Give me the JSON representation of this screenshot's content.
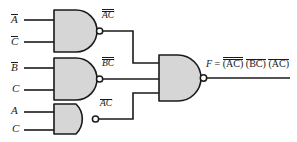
{
  "diagram": {
    "type": "logic-circuit",
    "colors": {
      "gate_fill": "#d6d6d6",
      "stroke": "#1a1a1a",
      "background": "#ffffff"
    },
    "gates": [
      {
        "id": "gate-1",
        "type": "NAND",
        "inputs": [
          "A̅",
          "C̅"
        ],
        "input_labels": [
          {
            "base": "A",
            "bar": true
          },
          {
            "base": "C",
            "bar": true
          }
        ],
        "output_label": {
          "base": "AC",
          "bars": 1,
          "inner_bars": "both"
        },
        "output_text": "AC"
      },
      {
        "id": "gate-2",
        "type": "NAND",
        "inputs": [
          "B̅",
          "C"
        ],
        "input_labels": [
          {
            "base": "B",
            "bar": true
          },
          {
            "base": "C",
            "bar": false
          }
        ],
        "output_label": {
          "base": "BC",
          "bars": 1,
          "inner_bars": "first"
        },
        "output_text": "BC"
      },
      {
        "id": "gate-3",
        "type": "NAND",
        "inputs": [
          "A",
          "C"
        ],
        "input_labels": [
          {
            "base": "A",
            "bar": false
          },
          {
            "base": "C",
            "bar": false
          }
        ],
        "output_label": {
          "base": "AC",
          "bars": 1,
          "inner_bars": "none"
        },
        "output_text": "AC"
      },
      {
        "id": "gate-4",
        "type": "NAND",
        "inputs": [
          "AC-bar",
          "BC-bar",
          "AC-bar"
        ],
        "output_text": "F"
      }
    ],
    "output_expression": {
      "lhs": "F",
      "equals": "=",
      "terms": [
        {
          "open": "(",
          "text": "AC",
          "close": ")"
        },
        {
          "open": "(",
          "text": "BC",
          "close": ")"
        },
        {
          "open": "(",
          "text": "AC",
          "close": ")"
        }
      ],
      "full_text": "F = (AC) (BC) (AC)"
    }
  }
}
